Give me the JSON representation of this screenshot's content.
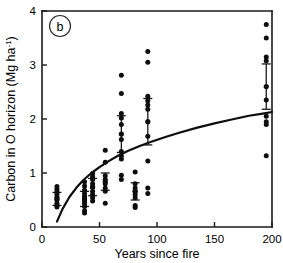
{
  "figure": {
    "panel_label": "b",
    "background_color": "#ffffff",
    "ink_color": "#0d0d0d"
  },
  "chart_data": {
    "type": "scatter",
    "title": "",
    "subtitle": "",
    "xlabel": "Years since fire",
    "ylabel": "Carbon in O horizon (Mg ha-1)",
    "ylabel_main": "Carbon in O horizon (Mg ha",
    "ylabel_sup": "-1",
    "ylabel_tail": ")",
    "xlim": [
      0,
      200
    ],
    "ylim": [
      0,
      4
    ],
    "xticks": [
      0,
      50,
      100,
      150,
      200
    ],
    "xtick_labels": [
      "0",
      "50",
      "100",
      "150",
      "200"
    ],
    "yticks": [
      0,
      1,
      2,
      3,
      4
    ],
    "ytick_labels": [
      "0",
      "1",
      "2",
      "3",
      "4"
    ],
    "grid": false,
    "legend": "none",
    "legend_position": "none",
    "points": [
      {
        "x": 13,
        "y": 0.75
      },
      {
        "x": 13,
        "y": 0.7
      },
      {
        "x": 13,
        "y": 0.65
      },
      {
        "x": 13,
        "y": 0.6
      },
      {
        "x": 13,
        "y": 0.55
      },
      {
        "x": 13,
        "y": 0.5
      },
      {
        "x": 13,
        "y": 0.44
      },
      {
        "x": 13,
        "y": 0.4
      },
      {
        "x": 13,
        "y": 0.37
      },
      {
        "x": 37,
        "y": 0.84
      },
      {
        "x": 37,
        "y": 0.76
      },
      {
        "x": 37,
        "y": 0.68
      },
      {
        "x": 37,
        "y": 0.62
      },
      {
        "x": 37,
        "y": 0.57
      },
      {
        "x": 37,
        "y": 0.52
      },
      {
        "x": 37,
        "y": 0.47
      },
      {
        "x": 37,
        "y": 0.43
      },
      {
        "x": 37,
        "y": 0.38
      },
      {
        "x": 37,
        "y": 0.3
      },
      {
        "x": 37,
        "y": 0.26
      },
      {
        "x": 44,
        "y": 0.99
      },
      {
        "x": 44,
        "y": 0.93
      },
      {
        "x": 44,
        "y": 0.88
      },
      {
        "x": 44,
        "y": 0.8
      },
      {
        "x": 44,
        "y": 0.74
      },
      {
        "x": 44,
        "y": 0.66
      },
      {
        "x": 44,
        "y": 0.6
      },
      {
        "x": 44,
        "y": 0.54
      },
      {
        "x": 44,
        "y": 0.48
      },
      {
        "x": 55,
        "y": 1.42
      },
      {
        "x": 55,
        "y": 1.2
      },
      {
        "x": 55,
        "y": 0.95
      },
      {
        "x": 55,
        "y": 0.88
      },
      {
        "x": 55,
        "y": 0.8
      },
      {
        "x": 55,
        "y": 0.72
      },
      {
        "x": 55,
        "y": 0.66
      },
      {
        "x": 55,
        "y": 0.44
      },
      {
        "x": 69,
        "y": 2.81
      },
      {
        "x": 69,
        "y": 2.47
      },
      {
        "x": 69,
        "y": 2.1
      },
      {
        "x": 69,
        "y": 2.02
      },
      {
        "x": 69,
        "y": 1.9
      },
      {
        "x": 69,
        "y": 1.62
      },
      {
        "x": 69,
        "y": 1.4
      },
      {
        "x": 69,
        "y": 1.32
      },
      {
        "x": 69,
        "y": 1.26
      },
      {
        "x": 69,
        "y": 0.96
      },
      {
        "x": 69,
        "y": 0.88
      },
      {
        "x": 81,
        "y": 1.02
      },
      {
        "x": 81,
        "y": 0.8
      },
      {
        "x": 81,
        "y": 0.72
      },
      {
        "x": 81,
        "y": 0.66
      },
      {
        "x": 81,
        "y": 0.6
      },
      {
        "x": 81,
        "y": 0.54
      },
      {
        "x": 81,
        "y": 0.4
      },
      {
        "x": 81,
        "y": 0.36
      },
      {
        "x": 92,
        "y": 3.25
      },
      {
        "x": 92,
        "y": 3.05
      },
      {
        "x": 92,
        "y": 2.42
      },
      {
        "x": 92,
        "y": 2.34
      },
      {
        "x": 92,
        "y": 2.26
      },
      {
        "x": 92,
        "y": 2.18
      },
      {
        "x": 92,
        "y": 1.68
      },
      {
        "x": 92,
        "y": 1.22
      },
      {
        "x": 92,
        "y": 0.72
      },
      {
        "x": 92,
        "y": 0.62
      },
      {
        "x": 195,
        "y": 3.75
      },
      {
        "x": 195,
        "y": 3.5
      },
      {
        "x": 195,
        "y": 3.15
      },
      {
        "x": 195,
        "y": 3.08
      },
      {
        "x": 195,
        "y": 2.35
      },
      {
        "x": 195,
        "y": 2.05
      },
      {
        "x": 195,
        "y": 1.95
      },
      {
        "x": 195,
        "y": 1.9
      },
      {
        "x": 195,
        "y": 1.32
      }
    ],
    "error_bars": [
      {
        "x": 13,
        "mean": 0.52,
        "low": 0.4,
        "high": 0.64
      },
      {
        "x": 37,
        "mean": 0.52,
        "low": 0.38,
        "high": 0.66
      },
      {
        "x": 44,
        "mean": 0.74,
        "low": 0.58,
        "high": 0.9
      },
      {
        "x": 55,
        "mean": 0.84,
        "low": 0.68,
        "high": 1.0
      },
      {
        "x": 69,
        "mean": 1.72,
        "low": 1.38,
        "high": 2.06
      },
      {
        "x": 81,
        "mean": 0.66,
        "low": 0.5,
        "high": 0.82
      },
      {
        "x": 92,
        "mean": 1.95,
        "low": 1.52,
        "high": 2.38
      },
      {
        "x": 195,
        "mean": 2.6,
        "low": 2.18,
        "high": 3.02
      }
    ],
    "fit_curve": {
      "description": "increasing saturating curve",
      "points": [
        {
          "x": 13,
          "y": 0.1
        },
        {
          "x": 18,
          "y": 0.34
        },
        {
          "x": 24,
          "y": 0.56
        },
        {
          "x": 30,
          "y": 0.73
        },
        {
          "x": 36,
          "y": 0.87
        },
        {
          "x": 43,
          "y": 1.0
        },
        {
          "x": 50,
          "y": 1.11
        },
        {
          "x": 58,
          "y": 1.22
        },
        {
          "x": 66,
          "y": 1.32
        },
        {
          "x": 75,
          "y": 1.41
        },
        {
          "x": 85,
          "y": 1.5
        },
        {
          "x": 95,
          "y": 1.58
        },
        {
          "x": 108,
          "y": 1.67
        },
        {
          "x": 120,
          "y": 1.75
        },
        {
          "x": 135,
          "y": 1.84
        },
        {
          "x": 150,
          "y": 1.92
        },
        {
          "x": 165,
          "y": 1.99
        },
        {
          "x": 180,
          "y": 2.06
        },
        {
          "x": 192,
          "y": 2.1
        },
        {
          "x": 200,
          "y": 2.13
        }
      ]
    }
  }
}
